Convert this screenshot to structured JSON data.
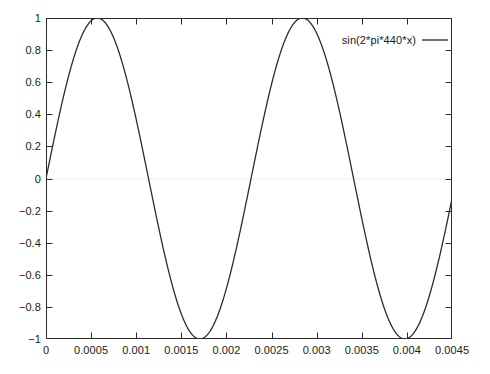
{
  "chart_data": {
    "type": "line",
    "title": "",
    "xlabel": "",
    "ylabel": "",
    "xlim": [
      0,
      0.0045
    ],
    "ylim": [
      -1,
      1
    ],
    "grid": "zero-line-only",
    "legend_position": "top-right",
    "x_ticks": [
      0,
      0.0005,
      0.001,
      0.0015,
      0.002,
      0.0025,
      0.003,
      0.0035,
      0.004,
      0.0045
    ],
    "x_tick_labels": [
      "0",
      "0.0005",
      "0.001",
      "0.0015",
      "0.002",
      "0.0025",
      "0.003",
      "0.0035",
      "0.004",
      "0.0045"
    ],
    "y_ticks": [
      -1,
      -0.8,
      -0.6,
      -0.4,
      -0.2,
      0,
      0.2,
      0.4,
      0.6,
      0.8,
      1
    ],
    "y_tick_labels": [
      "-1",
      "-0.8",
      "-0.6",
      "-0.4",
      "-0.2",
      "0",
      "0.2",
      "0.4",
      "0.6",
      "0.8",
      "1"
    ],
    "series": [
      {
        "name": "sin(2*pi*440*x)",
        "color": "#2b2b2b",
        "frequency_hz": 440,
        "amplitude": 1,
        "phase": 0,
        "peaks_x": [
          0.000568,
          0.002841
        ],
        "troughs_x": [
          0.001705,
          0.003977
        ],
        "zero_crossings_x": [
          0,
          0.001136,
          0.002273,
          0.003409,
          0.004545
        ],
        "x": [
          0,
          9.38e-05,
          0.0001875,
          0.0002813,
          0.000375,
          0.0004688,
          0.0005625,
          0.0006563,
          0.00075,
          0.0008438,
          0.0009375,
          0.0010313,
          0.001125,
          0.0012188,
          0.0013125,
          0.0014063,
          0.0015,
          0.0015938,
          0.0016875,
          0.0017813,
          0.001875,
          0.0019688,
          0.0020625,
          0.0021563,
          0.00225,
          0.0023438,
          0.0024375,
          0.0025313,
          0.002625,
          0.0027188,
          0.0028125,
          0.0029063,
          0.003,
          0.0030938,
          0.0031875,
          0.0032813,
          0.003375,
          0.0034688,
          0.0035625,
          0.0036563,
          0.00375,
          0.0038438,
          0.0039375,
          0.0040313,
          0.004125,
          0.0042188,
          0.0043125,
          0.0044063,
          0.0045
        ],
        "y": [
          0,
          0.2549,
          0.4929,
          0.6984,
          0.8577,
          0.9602,
          0.999,
          0.9714,
          0.8794,
          0.7289,
          0.5299,
          0.2955,
          0.0416,
          -0.2143,
          -0.4545,
          -0.6631,
          -0.8262,
          -0.9336,
          -0.9787,
          -0.9591,
          -0.8764,
          -0.7363,
          -0.5484,
          -0.3253,
          -0.0831,
          0.1734,
          0.4152,
          0.6267,
          0.7935,
          0.9048,
          0.9541,
          0.9387,
          0.8604,
          0.7241,
          0.5397,
          0.3195,
          0.0785,
          -0.1733,
          -0.4133,
          -0.6248,
          -0.7917,
          -0.9034,
          -0.9533,
          -0.9385,
          -0.8608,
          -0.7249,
          -0.5409,
          -0.3209,
          -0.0801
        ]
      }
    ]
  },
  "legend": {
    "entry_label": "sin(2*pi*440*x)"
  },
  "axes": {
    "y_labels": [
      "1",
      "0.8",
      "0.6",
      "0.4",
      "0.2",
      "0",
      "-0.2",
      "-0.4",
      "-0.6",
      "-0.8",
      "-1"
    ],
    "x_labels": [
      "0",
      "0.0005",
      "0.001",
      "0.0015",
      "0.002",
      "0.0025",
      "0.003",
      "0.0035",
      "0.004",
      "0.0045"
    ]
  }
}
